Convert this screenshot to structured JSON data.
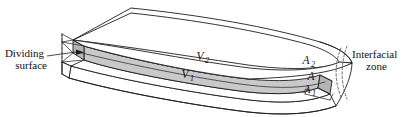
{
  "figure": {
    "type": "3d-schematic-diagram",
    "width": 406,
    "height": 117,
    "background_color": "#ffffff",
    "line_color": "#1d1d1d",
    "shade_color": "#c9c9c9",
    "shade_color_dark": "#b4b4b4"
  },
  "labels": {
    "dividing_surface": {
      "line1": "Dividing",
      "line2": "surface"
    },
    "interfacial_zone": {
      "line1": "Interfacial",
      "line2": "zone"
    },
    "volume_upper": {
      "symbol": "V",
      "subscript": "2"
    },
    "volume_lower": {
      "symbol": "V",
      "subscript": "1"
    },
    "area_upper": {
      "symbol": "A",
      "subscript": "2"
    },
    "area_dividing": {
      "symbol": "A",
      "subscript": ""
    },
    "area_lower": {
      "symbol": "A",
      "subscript": "1"
    }
  }
}
